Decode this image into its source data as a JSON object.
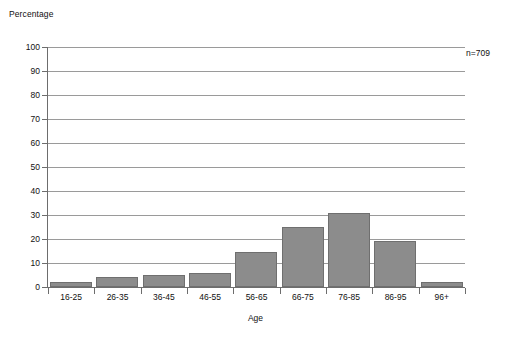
{
  "chart_data": {
    "type": "bar",
    "title": "",
    "xlabel": "Age",
    "ylabel": "Percentage",
    "categories": [
      "16-25",
      "26-35",
      "36-45",
      "46-55",
      "56-65",
      "66-75",
      "76-85",
      "86-95",
      "96+"
    ],
    "values": [
      2,
      4,
      5,
      6,
      14.5,
      25,
      31,
      19,
      2
    ],
    "ylim": [
      0,
      100
    ],
    "ytick_labels": [
      "100",
      "90",
      "80",
      "70",
      "60",
      "50",
      "40",
      "30",
      "20",
      "10",
      "0"
    ],
    "ytick_values": [
      100,
      90,
      80,
      70,
      60,
      50,
      40,
      30,
      20,
      10,
      0
    ],
    "grid": true,
    "legend": "none",
    "annotations": [
      {
        "text": "n=709",
        "x": "right",
        "y": "top"
      }
    ],
    "series_color": "#8c8c8c",
    "series_border_color": "#6f6f6f",
    "axis_color": "#6d6d6d",
    "grid_color": "#9a9a9a"
  }
}
